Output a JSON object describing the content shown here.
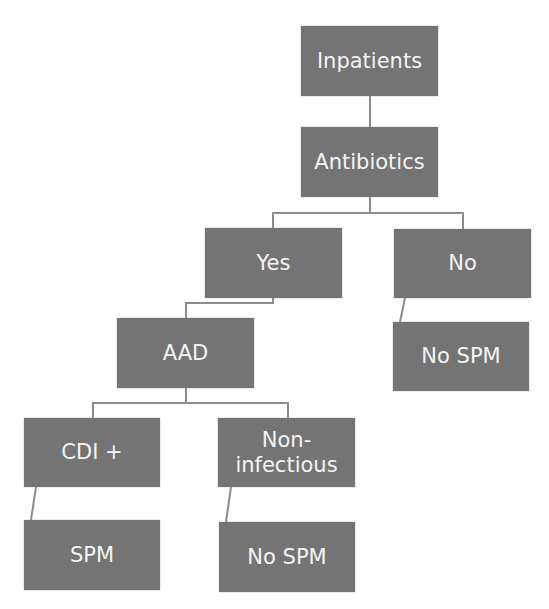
{
  "diagram": {
    "type": "decision-tree",
    "node_color": "#747474",
    "text_color": "#f4f4f4",
    "line_color": "#8c8c8c",
    "nodes": {
      "inpatients": {
        "label": "Inpatients"
      },
      "antibiotics": {
        "label": "Antibiotics"
      },
      "yes": {
        "label": "Yes"
      },
      "no": {
        "label": "No"
      },
      "aad": {
        "label": "AAD"
      },
      "no_spm_right": {
        "label": "No SPM"
      },
      "cdi_plus": {
        "label": "CDI +"
      },
      "non_infectious": {
        "label": "Non-\ninfectious"
      },
      "spm": {
        "label": "SPM"
      },
      "no_spm_bottom": {
        "label": "No SPM"
      }
    },
    "edges": [
      [
        "inpatients",
        "antibiotics"
      ],
      [
        "antibiotics",
        "yes"
      ],
      [
        "antibiotics",
        "no"
      ],
      [
        "yes",
        "aad"
      ],
      [
        "no",
        "no_spm_right"
      ],
      [
        "aad",
        "cdi_plus"
      ],
      [
        "aad",
        "non_infectious"
      ],
      [
        "cdi_plus",
        "spm"
      ],
      [
        "non_infectious",
        "no_spm_bottom"
      ]
    ]
  }
}
